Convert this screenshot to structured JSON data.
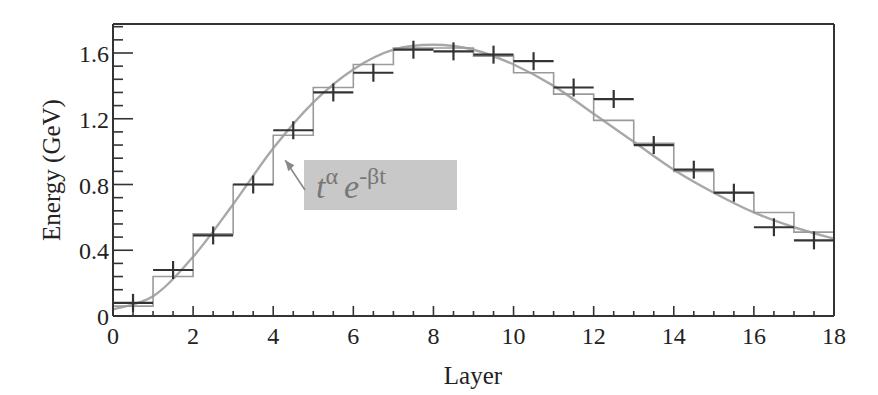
{
  "chart_data": {
    "type": "line",
    "title": "",
    "xlabel": "Layer",
    "ylabel": "Energy (GeV)",
    "xlim": [
      0,
      18
    ],
    "ylim": [
      0,
      1.78
    ],
    "x_ticks": [
      0,
      2,
      4,
      6,
      8,
      10,
      12,
      14,
      16,
      18
    ],
    "x_tick_labels": [
      "0",
      "2",
      "4",
      "6",
      "8",
      "10",
      "12",
      "14",
      "16",
      "18"
    ],
    "y_ticks": [
      0,
      0.4,
      0.8,
      1.2,
      1.6
    ],
    "y_tick_labels": [
      "0",
      "0.4",
      "0.8",
      "1.2",
      "1.6"
    ],
    "grid": false,
    "legend": null,
    "series": [
      {
        "name": "Data",
        "style": "points with x error bars (black crosses)",
        "color": "#333333",
        "x": [
          0.5,
          1.5,
          2.5,
          3.5,
          4.5,
          5.5,
          6.5,
          7.5,
          8.5,
          9.5,
          10.5,
          11.5,
          12.5,
          13.5,
          14.5,
          15.5,
          16.5,
          17.5
        ],
        "values": [
          0.08,
          0.28,
          0.49,
          0.8,
          1.13,
          1.36,
          1.48,
          1.62,
          1.61,
          1.59,
          1.55,
          1.39,
          1.32,
          1.04,
          0.89,
          0.75,
          0.54,
          0.46
        ]
      },
      {
        "name": "Simulation",
        "style": "step histogram (gray)",
        "color": "#999999",
        "bin_edges": [
          0,
          1,
          2,
          3,
          4,
          5,
          6,
          7,
          8,
          9,
          10,
          11,
          12,
          13,
          14,
          15,
          16,
          17,
          18
        ],
        "values": [
          0.06,
          0.24,
          0.5,
          0.8,
          1.1,
          1.39,
          1.53,
          1.63,
          1.63,
          1.58,
          1.48,
          1.35,
          1.19,
          1.05,
          0.88,
          0.75,
          0.63,
          0.51
        ]
      },
      {
        "name": "Fit t^α e^(-βt)",
        "style": "smooth curve (gray)",
        "color": "#a0a0a0",
        "x": [
          0,
          1,
          2,
          3,
          4,
          5,
          6,
          7,
          8,
          9,
          10,
          11,
          12,
          13,
          14,
          15,
          16,
          17,
          18
        ],
        "values": [
          0.04,
          0.12,
          0.36,
          0.68,
          1.02,
          1.3,
          1.5,
          1.62,
          1.65,
          1.62,
          1.53,
          1.4,
          1.23,
          1.06,
          0.89,
          0.75,
          0.63,
          0.54,
          0.47
        ]
      }
    ],
    "annotations": [
      {
        "text_base": "t",
        "text_sup": "α",
        "text_base2": "e",
        "text_sup2": "-βt",
        "box_color": "#c8c8c8",
        "arrow_to": {
          "x": 4.25,
          "y": 0.96
        }
      }
    ]
  },
  "colors": {
    "axis": "#333333",
    "data": "#333333",
    "histogram": "#9a9a9a",
    "fit": "#a8a8a8",
    "annotation_box": "#c9c9c9",
    "annotation_text": "#7a7a7a"
  }
}
